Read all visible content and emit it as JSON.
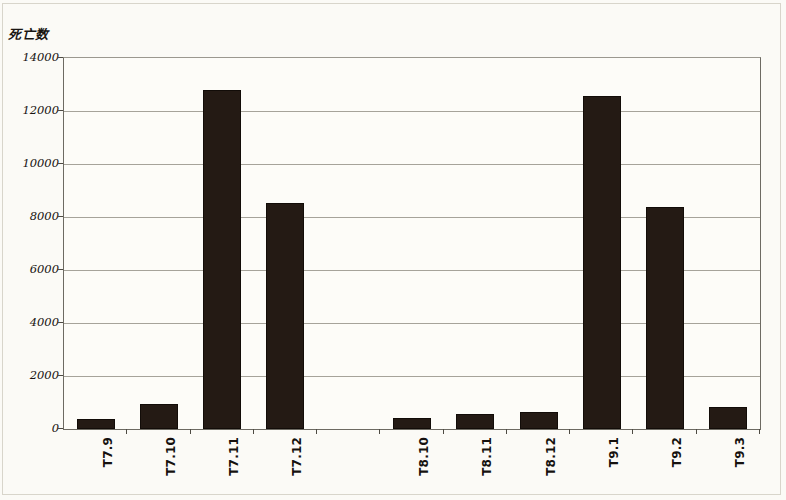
{
  "figure": {
    "y_axis_title": "死亡数",
    "background_color": "#fbfaf6",
    "bar_color": "#241a14",
    "gridline_color": "#a6a39a",
    "axis_color": "#6d6a62"
  },
  "chart_data": {
    "type": "bar",
    "title": "",
    "subtitle": "",
    "xlabel": "",
    "ylabel": "死亡数",
    "ylim": [
      0,
      14000
    ],
    "ytick_labels": [
      "14000",
      "12000",
      "10000",
      "8000",
      "6000",
      "4000",
      "2000",
      "0"
    ],
    "yticks": [
      14000,
      12000,
      10000,
      8000,
      6000,
      4000,
      2000,
      0
    ],
    "grid": true,
    "legend": null,
    "legend_position": "none",
    "categories": [
      "T7.9",
      "T7.10",
      "T7.11",
      "T7.12",
      "",
      "T8.10",
      "T8.11",
      "T8.12",
      "T9.1",
      "T9.2",
      "T9.3"
    ],
    "values": [
      380,
      950,
      12790,
      8520,
      null,
      420,
      560,
      650,
      12560,
      8380,
      830
    ],
    "series": [
      {
        "name": "死亡数",
        "values": [
          380,
          950,
          12790,
          8520,
          null,
          420,
          560,
          650,
          12560,
          8380,
          830
        ]
      }
    ],
    "annotations": []
  }
}
